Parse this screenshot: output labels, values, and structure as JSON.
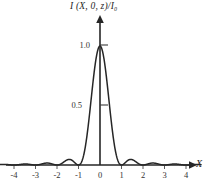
{
  "figure": {
    "name": "diffraction-intensity-profile",
    "background_color": "#ffffff",
    "line_color": "#262626",
    "axis_color": "#262626"
  },
  "axes": {
    "y_title": "I (X, 0, z)/I₀",
    "x_title": "X"
  },
  "chart_data": {
    "type": "line",
    "title": "",
    "subtitle": "",
    "xlabel": "X",
    "ylabel": "I (X, 0, z)/I₀",
    "xlim": [
      -4.7,
      4.7
    ],
    "ylim": [
      0,
      1.08
    ],
    "grid": false,
    "legend": null,
    "x_ticks": [
      -4,
      -3,
      -2,
      -1,
      0,
      1,
      2,
      3,
      4
    ],
    "x_tick_labels": [
      "-4",
      "-3",
      "-2",
      "-1",
      "0",
      "1",
      "2",
      "3",
      "4"
    ],
    "y_ticks": [
      0.5,
      1.0
    ],
    "y_tick_labels": [
      "0.5",
      "1.0"
    ],
    "series": [
      {
        "name": "normalized-intensity",
        "function": "sinc-squared",
        "peak_value": 1.0,
        "peak_x": 0,
        "zeros": [
          -4,
          -3,
          -2,
          -1,
          1,
          2,
          3,
          4
        ],
        "side_lobe_peaks": [
          {
            "x": -3.47,
            "y": 0.008
          },
          {
            "x": -2.46,
            "y": 0.017
          },
          {
            "x": -1.43,
            "y": 0.047
          },
          {
            "x": 1.43,
            "y": 0.047
          },
          {
            "x": 2.46,
            "y": 0.017
          },
          {
            "x": 3.47,
            "y": 0.008
          }
        ],
        "x": [
          -4.7,
          -4.5,
          -4.25,
          -4.0,
          -3.75,
          -3.47,
          -3.25,
          -3.0,
          -2.75,
          -2.46,
          -2.25,
          -2.0,
          -1.75,
          -1.43,
          -1.25,
          -1.0,
          -0.9,
          -0.8,
          -0.7,
          -0.6,
          -0.5,
          -0.4,
          -0.3,
          -0.2,
          -0.1,
          0.0,
          0.1,
          0.2,
          0.3,
          0.4,
          0.5,
          0.6,
          0.7,
          0.8,
          0.9,
          1.0,
          1.25,
          1.43,
          1.75,
          2.0,
          2.25,
          2.46,
          2.75,
          3.0,
          3.25,
          3.47,
          3.75,
          4.0,
          4.25,
          4.5,
          4.7
        ],
        "y": [
          0.004,
          0.005,
          0.003,
          0.0,
          0.005,
          0.008,
          0.007,
          0.0,
          0.009,
          0.017,
          0.014,
          0.0,
          0.021,
          0.047,
          0.04,
          0.0,
          0.01,
          0.041,
          0.093,
          0.165,
          0.255,
          0.357,
          0.468,
          0.587,
          0.712,
          1.0,
          0.712,
          0.587,
          0.468,
          0.357,
          0.255,
          0.165,
          0.093,
          0.041,
          0.01,
          0.0,
          0.04,
          0.047,
          0.021,
          0.0,
          0.014,
          0.017,
          0.009,
          0.0,
          0.007,
          0.008,
          0.005,
          0.0,
          0.003,
          0.005,
          0.004
        ]
      }
    ]
  }
}
